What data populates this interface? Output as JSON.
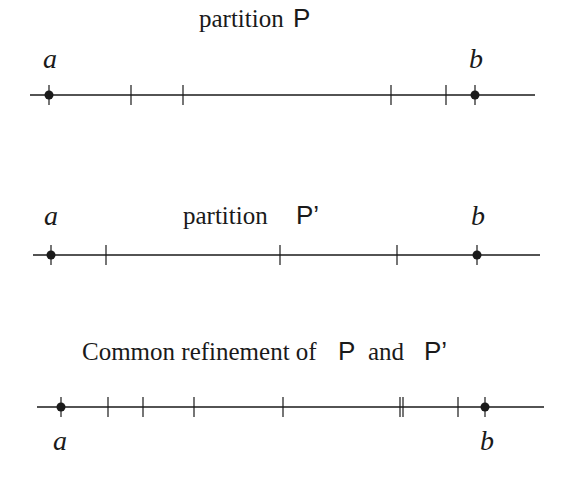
{
  "diagram": {
    "panels": [
      {
        "title_text": "partition",
        "title_symbol": "P",
        "line": {
          "y": 95,
          "x1": 30,
          "x2": 535
        },
        "endpoints": [
          {
            "label": "a",
            "x": 49
          },
          {
            "label": "b",
            "x": 475
          }
        ],
        "ticks": [
          131,
          183,
          391,
          446
        ],
        "label_position": "above"
      },
      {
        "title_text": "partition",
        "title_symbol": "P’",
        "line": {
          "y": 255,
          "x1": 33,
          "x2": 540
        },
        "endpoints": [
          {
            "label": "a",
            "x": 51
          },
          {
            "label": "b",
            "x": 477
          }
        ],
        "ticks": [
          106,
          280,
          397
        ],
        "label_position": "above"
      },
      {
        "title_prefix": "Common refinement of",
        "title_symbol1": "P",
        "title_mid": "and",
        "title_symbol2": "P’",
        "line": {
          "y": 407,
          "x1": 37,
          "x2": 544
        },
        "endpoints": [
          {
            "label": "a",
            "x": 61
          },
          {
            "label": "b",
            "x": 485
          }
        ],
        "ticks": [
          108,
          143,
          194,
          283,
          400,
          403,
          458
        ],
        "label_position": "below"
      }
    ]
  },
  "colors": {
    "ink": "#1a1a1a",
    "background": "#ffffff"
  }
}
